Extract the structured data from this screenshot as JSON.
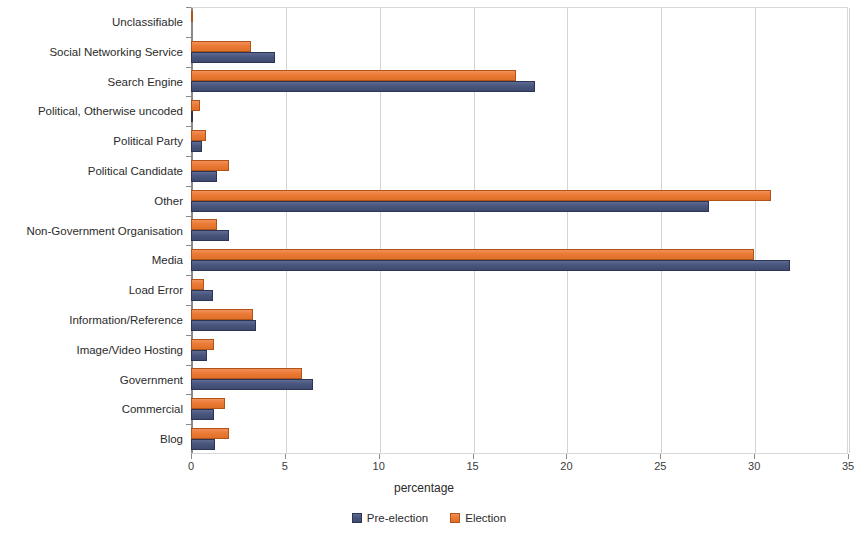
{
  "chart_data": {
    "type": "bar",
    "orientation": "horizontal",
    "title": "",
    "xlabel": "percentage",
    "ylabel": "",
    "xlim": [
      0,
      35
    ],
    "xticks": [
      0,
      5,
      10,
      15,
      20,
      25,
      30,
      35
    ],
    "grid": true,
    "legend_position": "bottom",
    "categories": [
      "Unclassifiable",
      "Social Networking Service",
      "Search Engine",
      "Political, Otherwise uncoded",
      "Political Party",
      "Political Candidate",
      "Other",
      "Non-Government Organisation",
      "Media",
      "Load Error",
      "Information/Reference",
      "Image/Video Hosting",
      "Government",
      "Commercial",
      "Blog"
    ],
    "series": [
      {
        "name": "Pre-election",
        "color": "#49557c",
        "values": [
          0.0,
          4.5,
          18.3,
          0.05,
          0.6,
          1.4,
          27.6,
          2.0,
          31.9,
          1.15,
          3.45,
          0.85,
          6.5,
          1.2,
          1.3
        ]
      },
      {
        "name": "Election",
        "color": "#ea7a35",
        "values": [
          0.05,
          3.2,
          17.3,
          0.5,
          0.8,
          2.0,
          30.9,
          1.4,
          30.0,
          0.7,
          3.3,
          1.2,
          5.9,
          1.8,
          2.0
        ]
      }
    ]
  },
  "axis": {
    "tick_labels": [
      "0",
      "5",
      "10",
      "15",
      "20",
      "25",
      "30",
      "35"
    ],
    "x_title": "percentage"
  },
  "legend": {
    "items": [
      {
        "label": "Pre-election"
      },
      {
        "label": "Election"
      }
    ]
  }
}
